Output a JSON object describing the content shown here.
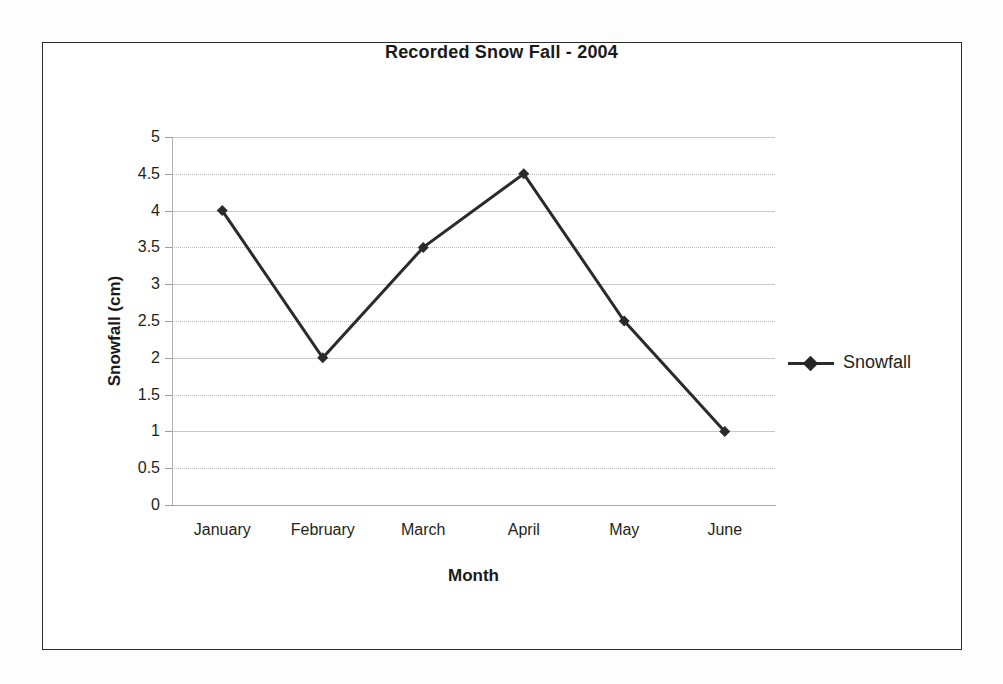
{
  "chart_data": {
    "type": "line",
    "title": "Recorded Snow Fall - 2004",
    "xlabel": "Month",
    "ylabel": "Snowfall  (cm)",
    "categories": [
      "January",
      "February",
      "March",
      "April",
      "May",
      "June"
    ],
    "series": [
      {
        "name": "Snowfall",
        "values": [
          4,
          2,
          3.5,
          4.5,
          2.5,
          1
        ],
        "marker": "diamond",
        "color": "#2b2b2b"
      }
    ],
    "ylim": [
      0,
      5
    ],
    "ytick_step": 0.5,
    "yticks": [
      "5",
      "4.5",
      "4",
      "3.5",
      "3",
      "2.5",
      "2",
      "1.5",
      "1",
      "0.5",
      "0"
    ],
    "grid": true,
    "grid_axis": "y",
    "legend_position": "right",
    "legend_entries": [
      "Snowfall"
    ]
  },
  "figure": {
    "border_color": "#2b2b2b",
    "background": "#ffffff",
    "gridline_color": "#b9b9b9",
    "axis_color": "#a8a8a8",
    "text_color": "#231f20"
  },
  "icons": {
    "legend_marker": "diamond-marker-icon"
  }
}
